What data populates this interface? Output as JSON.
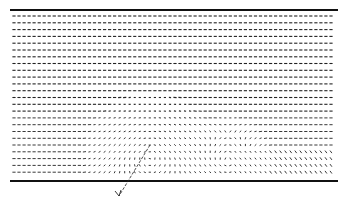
{
  "figure": {
    "type": "vector-field",
    "bounds": {
      "left": 10,
      "right": 338,
      "top": 10,
      "bottom": 181
    },
    "wall_color": "#111111",
    "vector_color": "#222222",
    "rows": 24,
    "cols": 64,
    "upper_wall_label": "",
    "pointer": {
      "x1": 150,
      "y1": 145,
      "x2": 119,
      "y2": 196,
      "label": "V"
    }
  }
}
